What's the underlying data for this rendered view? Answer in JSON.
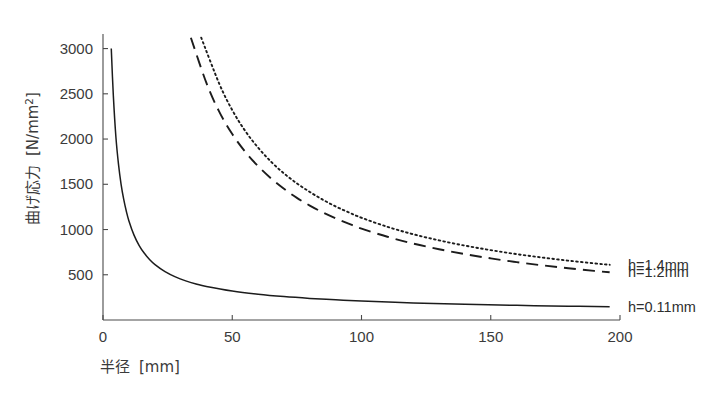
{
  "chart_data": {
    "type": "line",
    "title": "",
    "xlabel": "半径 [mm]",
    "ylabel": "曲げ応力 [N/mm2]",
    "ylabel_main": "曲げ応力",
    "ylabel_unit_open": "[N/mm",
    "ylabel_unit_sup": "2",
    "ylabel_unit_close": "]",
    "xlabel_main": "半径",
    "xlabel_unit": "[mm]",
    "xlim": [
      0,
      200
    ],
    "ylim": [
      0,
      3150
    ],
    "xticks": [
      0,
      50,
      100,
      150,
      200
    ],
    "xtick_labels": [
      "0",
      "50",
      "100",
      "150",
      "200"
    ],
    "yticks": [
      500,
      1000,
      1500,
      2000,
      2500,
      3000
    ],
    "ytick_labels": [
      "500",
      "1000",
      "1500",
      "2000",
      "2500",
      "3000"
    ],
    "grid": false,
    "legend_position": "right-inline",
    "series": [
      {
        "name": "h=1.4mm",
        "label": "h=1.4mm",
        "style": "dotted",
        "color": "#1c1c1c",
        "x": [
          38,
          45,
          50,
          55,
          60,
          65,
          70,
          75,
          80,
          85,
          90,
          95,
          100,
          110,
          120,
          130,
          140,
          150,
          160,
          170,
          180,
          190,
          196
        ],
        "y": [
          3120,
          2610,
          2320,
          2090,
          1905,
          1750,
          1620,
          1510,
          1415,
          1330,
          1255,
          1190,
          1130,
          1030,
          948,
          880,
          822,
          772,
          728,
          690,
          656,
          626,
          610
        ]
      },
      {
        "name": "h=1.2mm",
        "label": "h=1.2mm",
        "style": "dashed",
        "color": "#1c1c1c",
        "x": [
          34,
          40,
          45,
          50,
          55,
          60,
          65,
          70,
          75,
          80,
          85,
          90,
          95,
          100,
          110,
          120,
          130,
          140,
          150,
          160,
          170,
          180,
          190,
          196
        ],
        "y": [
          3120,
          2620,
          2300,
          2055,
          1860,
          1700,
          1565,
          1450,
          1350,
          1265,
          1190,
          1125,
          1065,
          1010,
          920,
          845,
          782,
          728,
          681,
          640,
          604,
          572,
          543,
          528
        ]
      },
      {
        "name": "h=0.11mm",
        "label": "h=0.11mm",
        "style": "solid",
        "color": "#1c1c1c",
        "x": [
          3.2,
          4,
          5,
          6,
          7,
          8,
          9,
          10,
          12,
          14,
          16,
          18,
          20,
          24,
          28,
          32,
          36,
          40,
          50,
          60,
          70,
          80,
          90,
          100,
          120,
          140,
          160,
          180,
          196
        ],
        "y": [
          3000,
          2480,
          2020,
          1720,
          1500,
          1335,
          1205,
          1098,
          938,
          823,
          737,
          669,
          615,
          534,
          476,
          432,
          398,
          370,
          320,
          285,
          259,
          239,
          223,
          210,
          189,
          174,
          162,
          153,
          147
        ]
      }
    ]
  },
  "axes_geometry": {
    "left": 103,
    "right": 620,
    "top": 35,
    "bottom": 320
  }
}
